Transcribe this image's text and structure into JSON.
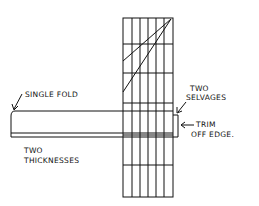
{
  "diagram": {
    "type": "sewing-fabric-cutting-diagram",
    "stroke_color": "#111111",
    "background": "#ffffff",
    "labels": {
      "single_fold": "SINGLE FOLD",
      "two_selvages_line1": "TWO",
      "two_selvages_line2": "SELVAGES",
      "trim_line1": "TRIM",
      "trim_line2": "OFF EDGE.",
      "thickness_line1": "TWO",
      "thickness_line2": "THICKNESSES"
    },
    "grid": {
      "x": [
        123,
        132,
        140,
        148,
        156,
        164,
        173
      ],
      "y": [
        18,
        44,
        73,
        103,
        135,
        165,
        197
      ]
    }
  }
}
